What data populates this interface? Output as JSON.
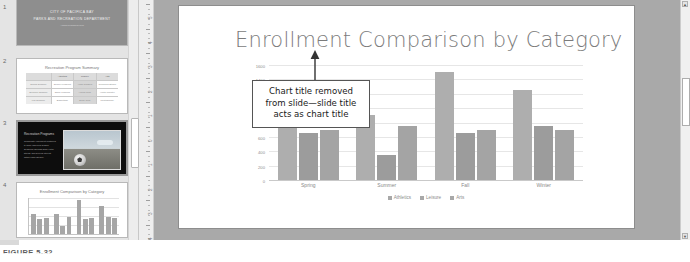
{
  "app": {
    "credit": "PowerPoint 2016, Windows 10, Microsoft Corporation"
  },
  "caption": {
    "figure_label": "FIGURE 5-32"
  },
  "thumbnails": [
    {
      "number": "1",
      "title_line1": "CITY OF PACIFICA BAY",
      "title_line2": "PARKS AND RECREATION DEPARTMENT",
      "subtitle": "Annual Program Review"
    },
    {
      "number": "2",
      "title": "Recreation Program Summary",
      "table": {
        "headers": [
          "",
          "Athletics",
          "Leisure",
          "Arts"
        ],
        "rows": [
          [
            "Spring Session",
            "Soccer Leagues",
            "Yoga Classes",
            "Ceramics Studio"
          ],
          [
            "Summer Session",
            "Swim Lessons",
            "Hiking Club",
            "Youth Theater"
          ],
          [
            "Fall Session",
            "Basketball",
            "Book Club",
            "Photography"
          ]
        ]
      }
    },
    {
      "number": "3",
      "heading": "Recreation Programs",
      "bullets": [
        "Community enrollment continues",
        "to build each new season",
        "Seasonal offerings span youth,",
        "fitness, and general interest",
        "within each category"
      ]
    },
    {
      "number": "4",
      "title": "Enrollment Comparison by Category"
    }
  ],
  "ruler": {
    "labels": [
      "5",
      "4",
      "3",
      "2",
      "1",
      "0",
      "1",
      "2",
      "3",
      "4"
    ]
  },
  "slide": {
    "title": "Enrollment Comparison by Category",
    "callout": {
      "line1": "Chart title removed",
      "line2": "from slide—slide title",
      "line3": "acts as chart title"
    }
  },
  "chart_data": {
    "type": "bar",
    "title": "",
    "categories": [
      "Spring",
      "Summer",
      "Fall",
      "Winter"
    ],
    "series": [
      {
        "name": "Athletics",
        "values": [
          900,
          900,
          1500,
          1250
        ]
      },
      {
        "name": "Leisure",
        "values": [
          650,
          350,
          650,
          750
        ]
      },
      {
        "name": "Arts",
        "values": [
          700,
          750,
          700,
          700
        ]
      }
    ],
    "xlabel": "",
    "ylabel": "",
    "ylim": [
      0,
      1600
    ],
    "yticks": [
      "1600",
      "1400",
      "1200",
      "1000",
      "800",
      "600",
      "400",
      "200",
      "0"
    ],
    "grid": true,
    "legend_position": "bottom"
  },
  "scrollbar": {
    "up_arrow": "▲",
    "down_arrow": "▼"
  }
}
